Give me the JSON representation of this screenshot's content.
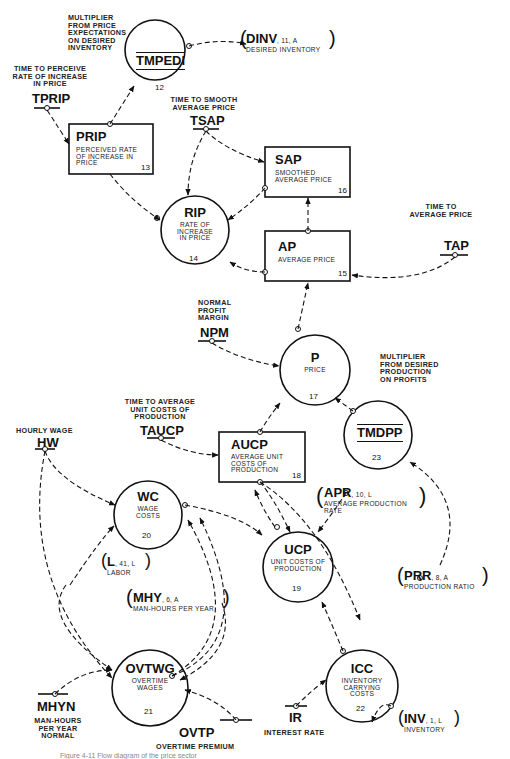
{
  "nodes": {
    "tmpedi": {
      "code": "TMPEDI",
      "number": "12",
      "annotation": [
        "MULTIPLIER",
        "FROM PRICE",
        "EXPECTATIONS",
        "ON DESIRED",
        "INVENTORY"
      ]
    },
    "prip": {
      "code": "PRIP",
      "desc": [
        "PERCEIVED RATE",
        "OF INCREASE IN",
        "PRICE"
      ],
      "number": "13"
    },
    "rip": {
      "code": "RIP",
      "desc": [
        "RATE OF",
        "INCREASE",
        "IN PRICE"
      ],
      "number": "14"
    },
    "sap": {
      "code": "SAP",
      "desc": [
        "SMOOTHED",
        "AVERAGE PRICE"
      ],
      "number": "16"
    },
    "ap": {
      "code": "AP",
      "desc": [
        "AVERAGE PRICE"
      ],
      "number": "15"
    },
    "p": {
      "code": "P",
      "desc": [
        "PRICE"
      ],
      "number": "17"
    },
    "tmdpp": {
      "code": "TMDPP",
      "number": "23",
      "annotation": [
        "MULTIPLIER",
        "FROM DESIRED",
        "PRODUCTION",
        "ON PROFITS"
      ]
    },
    "aucp": {
      "code": "AUCP",
      "desc": [
        "AVERAGE UNIT",
        "COSTS OF",
        "PRODUCTION"
      ],
      "number": "18"
    },
    "wc": {
      "code": "WC",
      "desc": [
        "WAGE",
        "COSTS"
      ],
      "number": "20"
    },
    "ucp": {
      "code": "UCP",
      "desc": [
        "UNIT COSTS OF",
        "PRODUCTION"
      ],
      "number": "19"
    },
    "icc": {
      "code": "ICC",
      "desc": [
        "INVENTORY",
        "CARRYING",
        "COSTS"
      ],
      "number": "22"
    },
    "ovtwg": {
      "code": "OVTWG",
      "desc": [
        "OVERTIME",
        "WAGES"
      ],
      "number": "21"
    }
  },
  "constants": {
    "tprip": {
      "code": "TPRIP",
      "label": [
        "TIME TO PERCEIVE",
        "RATE OF INCREASE",
        "IN PRICE"
      ]
    },
    "tsap": {
      "code": "TSAP",
      "label": [
        "TIME TO SMOOTH",
        "AVERAGE PRICE"
      ]
    },
    "tap": {
      "code": "TAP",
      "label": [
        "TIME TO",
        "AVERAGE PRICE"
      ]
    },
    "npm": {
      "code": "NPM",
      "label": [
        "NORMAL",
        "PROFIT",
        "MARGIN"
      ]
    },
    "taucp": {
      "code": "TAUCP",
      "label": [
        "TIME TO AVERAGE",
        "UNIT COSTS OF",
        "PRODUCTION"
      ]
    },
    "hw": {
      "code": "HW",
      "label": [
        "HOURLY WAGE"
      ]
    },
    "mhyn": {
      "code": "MHYN",
      "label": [
        "MAN-HOURS",
        "PER YEAR",
        "NORMAL"
      ]
    },
    "ovtp": {
      "code": "OVTP",
      "label": [
        "OVERTIME PREMIUM"
      ]
    },
    "ir": {
      "code": "IR",
      "label": [
        "INTEREST RATE"
      ]
    }
  },
  "external_refs": {
    "dinv": {
      "code": "DINV",
      "ref": ", 11, A",
      "label": "DESIRED INVENTORY"
    },
    "apr": {
      "code": "APR",
      "ref": ", 10, L",
      "label": [
        "AVERAGE PRODUCTION",
        "RATE"
      ]
    },
    "prr": {
      "code": "PRR",
      "ref": ", 8, A",
      "label": "PRODUCTION RATIO"
    },
    "l": {
      "code": "L",
      "ref": ", 41, L",
      "label": "LABOR"
    },
    "mhy": {
      "code": "MHY",
      "ref": ", 6, A",
      "label": "MAN-HOURS PER YEAR"
    },
    "inv": {
      "code": "INV",
      "ref": ", 1, L",
      "label": "INVENTORY"
    }
  },
  "caption": "Figure 4-11  Flow diagram of the price sector"
}
